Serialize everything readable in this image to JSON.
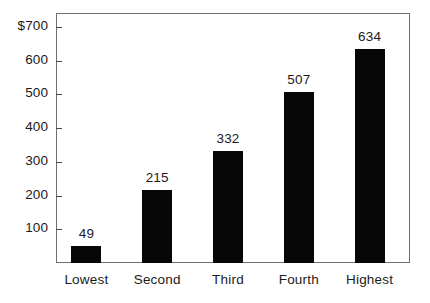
{
  "chart_data": {
    "type": "bar",
    "title": "",
    "subtitle": "",
    "xlabel": "",
    "ylabel": "",
    "categories": [
      "Lowest",
      "Second",
      "Third",
      "Fourth",
      "Highest"
    ],
    "values": [
      49,
      215,
      332,
      507,
      634
    ],
    "value_labels": [
      "49",
      "215",
      "332",
      "507",
      "634"
    ],
    "ytick_values": [
      100,
      200,
      300,
      400,
      500,
      600,
      700
    ],
    "ytick_labels": [
      "100",
      "200",
      "300",
      "400",
      "500",
      "600",
      "$700"
    ],
    "ylim": [
      0,
      722
    ],
    "xlim_categories": 5,
    "grid": false,
    "legend": null,
    "currency_symbol": "$",
    "colors": {
      "bar": "#070707",
      "frame": "#6f6f6f",
      "tick": "#4a4a4a",
      "text": "#1a1a1a",
      "background": "#ffffff"
    }
  }
}
